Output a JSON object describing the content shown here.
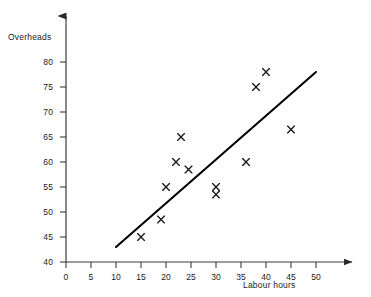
{
  "chart_data": {
    "type": "scatter",
    "title": "",
    "xlabel": "Labour hours",
    "ylabel": "Overheads",
    "xlim": [
      0,
      52
    ],
    "ylim": [
      40,
      81
    ],
    "xticks": [
      0,
      5,
      10,
      15,
      20,
      25,
      30,
      35,
      40,
      45,
      50
    ],
    "yticks": [
      40,
      45,
      50,
      55,
      60,
      65,
      70,
      75,
      80
    ],
    "grid": false,
    "legend": null,
    "marker": "x",
    "marker_color": "#1a1a1a",
    "line_color": "#000000",
    "axis_color": "#333333",
    "points": [
      {
        "x": 15,
        "y": 45
      },
      {
        "x": 19,
        "y": 48.5
      },
      {
        "x": 20,
        "y": 55
      },
      {
        "x": 22,
        "y": 60
      },
      {
        "x": 23,
        "y": 65
      },
      {
        "x": 24.5,
        "y": 58.5
      },
      {
        "x": 30,
        "y": 55
      },
      {
        "x": 30,
        "y": 53.5
      },
      {
        "x": 36,
        "y": 60
      },
      {
        "x": 38,
        "y": 75
      },
      {
        "x": 40,
        "y": 78
      },
      {
        "x": 45,
        "y": 66.5
      }
    ],
    "trend_line": {
      "x_start": 10,
      "y_start": 43,
      "x_end": 50,
      "y_end": 78
    },
    "annotations": []
  },
  "axes": {
    "y_title": "Overheads",
    "x_title": "Labour hours",
    "y_tick_labels": [
      "80",
      "75",
      "70",
      "65",
      "60",
      "55",
      "50",
      "45",
      "40"
    ],
    "x_tick_labels": [
      "0",
      "5",
      "10",
      "15",
      "20",
      "25",
      "30",
      "35",
      "40",
      "45",
      "50"
    ]
  }
}
